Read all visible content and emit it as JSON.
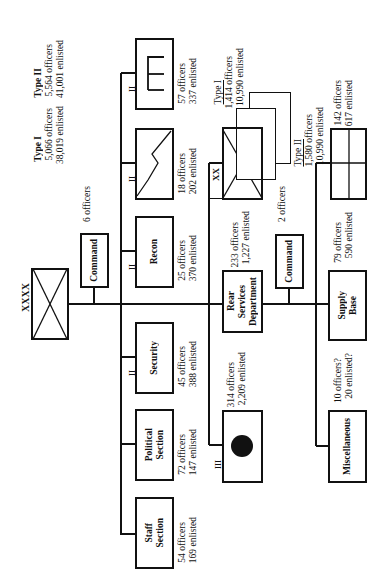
{
  "chart": {
    "hq": {
      "echelon": "XXXX",
      "symbol": "infantry-x"
    },
    "hq_command": {
      "label": "Command",
      "strength": "6 officers"
    },
    "type_totals": [
      {
        "label": "Type I",
        "officers": "5,066 officers",
        "enlisted": "38,019 enlisted"
      },
      {
        "label": "Type II",
        "officers": "5,564 officers",
        "enlisted": "41,001 enlisted"
      }
    ],
    "staff_units": [
      {
        "id": "engineer",
        "label": "",
        "symbol": "E",
        "officers": "57 officers",
        "enlisted": "337 enlisted",
        "echelon": "II"
      },
      {
        "id": "signal",
        "label": "",
        "symbol": "zigzag",
        "officers": "18 officers",
        "enlisted": "202 enlisted",
        "echelon": "II"
      },
      {
        "id": "recon",
        "label": "Recon",
        "officers": "25 officers",
        "enlisted": "370 enlisted",
        "echelon": "II"
      },
      {
        "id": "security",
        "label": "Security",
        "officers": "45 officers",
        "enlisted": "388 enlisted",
        "echelon": "II"
      },
      {
        "id": "political",
        "label": "Political Section",
        "label_lines": [
          "Political",
          "Section"
        ],
        "officers": "72 officers",
        "enlisted": "147 enlisted"
      },
      {
        "id": "staff",
        "label": "Staff Section",
        "label_lines": [
          "Staff",
          "Section"
        ],
        "officers": "54 officers",
        "enlisted": "169 enlisted"
      }
    ],
    "division": {
      "echelon": "XX",
      "types": [
        {
          "label": "Type I",
          "officers": "1,414 officers",
          "enlisted": "10,990 enlisted"
        },
        {
          "label": "Type II",
          "officers": "1,580 officers",
          "enlisted": "10,990 enlisted"
        }
      ]
    },
    "rear_services": {
      "label_lines": [
        "Rear",
        "Services",
        "Department"
      ],
      "officers": "233 officers",
      "enlisted": "1,227 enlisted"
    },
    "rear_command": {
      "label": "Command",
      "strength": "2 officers"
    },
    "medical": {
      "symbol": "dot",
      "officers": "314 officers",
      "enlisted": "2,209 enlisted",
      "echelon": "III"
    },
    "rear_units": [
      {
        "id": "quartermaster",
        "symbol": "grid",
        "officers": "142 officers",
        "enlisted": "617 enlisted"
      },
      {
        "id": "supply-base",
        "label_lines": [
          "Supply",
          "Base"
        ],
        "officers": "79 officers",
        "enlisted": "590 enlisted"
      },
      {
        "id": "misc",
        "label": "Miscellaneous",
        "officers": "10 officers?",
        "enlisted": "20 enlisted?"
      }
    ],
    "echelon_marks": {
      "two": "II",
      "three": "III"
    }
  }
}
